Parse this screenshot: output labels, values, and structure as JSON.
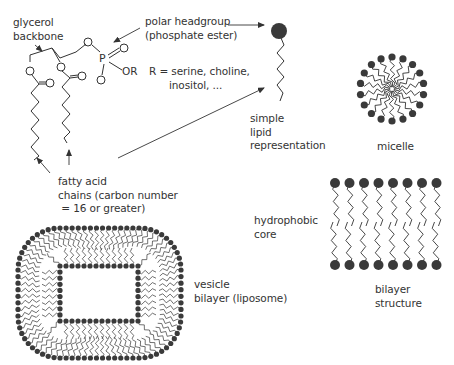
{
  "labels": {
    "glycerol": [
      "glycerol",
      "backbone"
    ],
    "headgroup": [
      "polar headgroup",
      "(phosphate ester)"
    ],
    "r_group": [
      "R = serine, choline,",
      "inositol, ..."
    ],
    "simple_lipid": [
      "simple",
      "lipid",
      "representation"
    ],
    "micelle": "micelle",
    "fatty_acid": [
      "fatty acid",
      "chains (carbon number",
      " = 16 or greater)"
    ],
    "hydrophobic": [
      "hydrophobic",
      "core"
    ],
    "vesicle": [
      "vesicle",
      "bilayer (liposome)"
    ],
    "bilayer": [
      "bilayer",
      "structure"
    ]
  },
  "chem": {
    "phosphorus": "P",
    "or": "OR"
  },
  "colors": {
    "ink": "#333333",
    "head": "#3a3a3a",
    "background": "#ffffff"
  }
}
